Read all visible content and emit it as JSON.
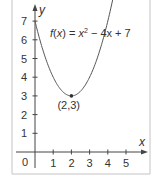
{
  "chart_data": {
    "type": "line",
    "title": "",
    "function": "f(x) = x² − 4x + 7",
    "formula_parts": {
      "f": "f",
      "open": "(",
      "x": "x",
      "close_eq": ") = ",
      "x2": "x",
      "sup": "2",
      "rest": " − 4x + 7"
    },
    "xlabel": "x",
    "ylabel": "y",
    "origin_label": "0",
    "x_ticks": [
      "1",
      "2",
      "3",
      "4",
      "5"
    ],
    "y_ticks": [
      "1",
      "2",
      "3",
      "4",
      "5",
      "6",
      "7"
    ],
    "xlim": [
      0,
      6
    ],
    "ylim": [
      0,
      8
    ],
    "grid": false,
    "legend": "none",
    "series": [
      {
        "name": "f(x) = x² − 4x + 7",
        "x": [
          0,
          0.5,
          1,
          1.5,
          2,
          2.5,
          3,
          3.5,
          4,
          4.3
        ],
        "y": [
          7,
          5.25,
          4,
          3.25,
          3,
          3.25,
          4,
          5.25,
          7,
          8.29
        ]
      }
    ],
    "annotations": [
      {
        "label": "(2,3)",
        "x": 2,
        "y": 3,
        "type": "vertex-point"
      }
    ],
    "colors": {
      "curve": "#555555",
      "axis": "#444444",
      "frame": "#bbbbbb",
      "text": "#333333"
    }
  }
}
